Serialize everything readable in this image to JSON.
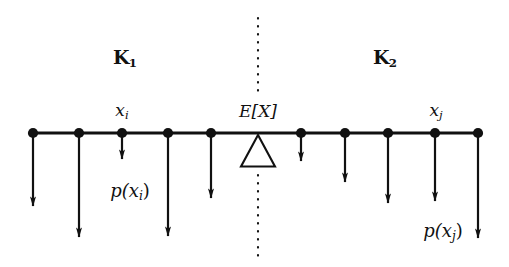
{
  "figure": {
    "type": "diagram",
    "background_color": "#ffffff",
    "ink_color": "#111111",
    "width": 509,
    "height": 267
  },
  "chart_data": {
    "type": "scatter",
    "title": "",
    "xlabel": "",
    "ylabel": "",
    "axis_line_y": 133,
    "axis_x_range": [
      33,
      478
    ],
    "grid": false,
    "legend": false,
    "points": [
      {
        "index": 1,
        "x": 33,
        "arrow_end_y": 216,
        "arrow_length": 83,
        "region": "K1",
        "label": "",
        "weight_label": ""
      },
      {
        "index": 2,
        "x": 79,
        "arrow_end_y": 247,
        "arrow_length": 114,
        "region": "K1",
        "label": "",
        "weight_label": ""
      },
      {
        "index": 3,
        "x": 122,
        "arrow_end_y": 169,
        "arrow_length": 36,
        "region": "K1",
        "label": "x_i",
        "weight_label": "p(x_i)"
      },
      {
        "index": 4,
        "x": 168,
        "arrow_end_y": 246,
        "arrow_length": 113,
        "region": "K1",
        "label": "",
        "weight_label": ""
      },
      {
        "index": 5,
        "x": 211,
        "arrow_end_y": 208,
        "arrow_length": 75,
        "region": "K1",
        "label": "",
        "weight_label": ""
      },
      {
        "index": 6,
        "x": 301,
        "arrow_end_y": 171,
        "arrow_length": 38,
        "region": "K2",
        "label": "",
        "weight_label": ""
      },
      {
        "index": 7,
        "x": 345,
        "arrow_end_y": 192,
        "arrow_length": 59,
        "region": "K2",
        "label": "",
        "weight_label": ""
      },
      {
        "index": 8,
        "x": 388,
        "arrow_end_y": 213,
        "arrow_length": 80,
        "region": "K2",
        "label": "",
        "weight_label": ""
      },
      {
        "index": 9,
        "x": 435,
        "arrow_end_y": 211,
        "arrow_length": 78,
        "region": "K2",
        "label": "x_j",
        "weight_label": "p(x_j)"
      },
      {
        "index": 10,
        "x": 478,
        "arrow_end_y": 248,
        "arrow_length": 115,
        "region": "K2",
        "label": "",
        "weight_label": ""
      }
    ],
    "fulcrum": {
      "x": 258,
      "y": 133,
      "label": "E[X]",
      "half_width": 17,
      "height": 32
    },
    "divider": {
      "x": 258,
      "style": "dotted",
      "top_segment": [
        18,
        96
      ],
      "bottom_segment": [
        175,
        256
      ]
    }
  },
  "labels": {
    "region_left": {
      "symbol": "K",
      "subscript": "1",
      "x": 125,
      "y": 59
    },
    "region_right": {
      "symbol": "K",
      "subscript": "2",
      "x": 385,
      "y": 59
    },
    "point_i": {
      "symbol": "x",
      "subscript": "i",
      "x": 122,
      "y": 112
    },
    "point_j": {
      "symbol": "x",
      "subscript": "j",
      "x": 436,
      "y": 112
    },
    "expectation": {
      "text": "E[X]",
      "x": 258,
      "y": 111
    },
    "prob_i": {
      "prefix": "p(",
      "symbol": "x",
      "subscript": "i",
      "suffix": ")",
      "x": 130,
      "y": 192
    },
    "prob_j": {
      "prefix": "p(",
      "symbol": "x",
      "subscript": "j",
      "suffix": ")",
      "x": 443,
      "y": 232
    }
  },
  "text": {
    "k1": "K1",
    "k2": "K2",
    "xi": "xi",
    "xj": "xj",
    "expectation": "E[X]",
    "pxi": "p(xi)",
    "pxj": "p(xj)",
    "k_symbol": "K",
    "k1_sub": "1",
    "k2_sub": "2",
    "x_symbol": "x",
    "i_sub": "i",
    "j_sub": "j",
    "p_open": "p(",
    "p_close": ")"
  }
}
